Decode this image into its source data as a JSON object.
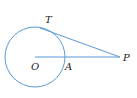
{
  "diagram": {
    "type": "geometry",
    "stroke_color": "#5b9bd5",
    "label_color": "#222222",
    "points": {
      "O": {
        "label": "O"
      },
      "A": {
        "label": "A"
      },
      "T": {
        "label": "T"
      },
      "P": {
        "label": "P"
      }
    },
    "elements": [
      {
        "kind": "circle",
        "center": "O",
        "through": "A"
      },
      {
        "kind": "segment",
        "from": "T",
        "to": "P",
        "note": "tangent"
      },
      {
        "kind": "segment",
        "from": "O",
        "to": "P"
      }
    ]
  }
}
